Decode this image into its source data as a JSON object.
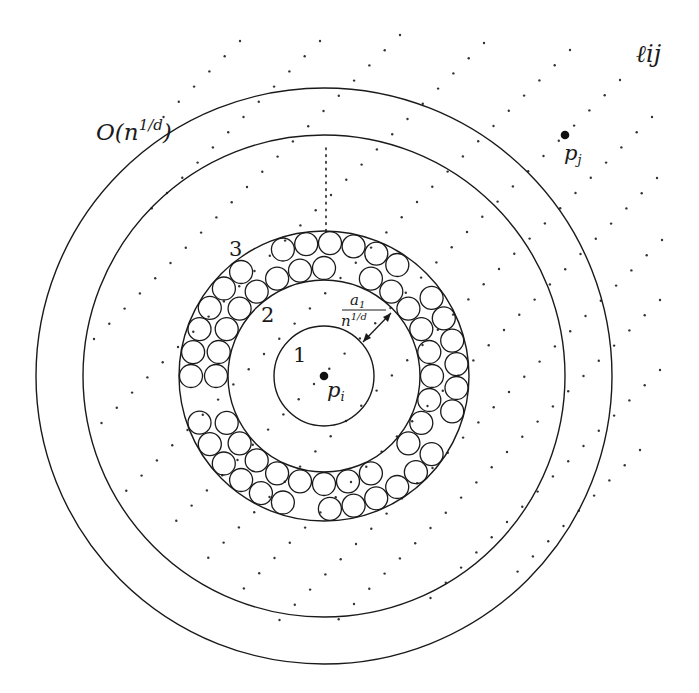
{
  "figure": {
    "center": {
      "x": 324,
      "y": 376
    },
    "circles": {
      "outer": {
        "r": 288,
        "label": "O(n^{1/d})"
      },
      "second": {
        "r": 241
      },
      "ring_outer": {
        "r": 145,
        "label": "3"
      },
      "ring_inner": {
        "r": 96,
        "label": "2"
      },
      "inner": {
        "r": 50,
        "label": "1"
      }
    },
    "small_circle_radius": 11.5,
    "points": {
      "p_i": {
        "x": 324,
        "y": 376,
        "label": "p",
        "sub": "i"
      },
      "p_j": {
        "x": 565,
        "y": 135,
        "label": "p",
        "sub": "j"
      }
    },
    "annotations": {
      "band_label": "ℓij",
      "arrow_label_num": "a",
      "arrow_label_num_sub": "1",
      "arrow_label_den": "n",
      "arrow_label_den_sup": "1/d",
      "outer_label_main": "O(n",
      "outer_label_sup": "1/d",
      "outer_label_close": ")",
      "label_1": "1",
      "label_2": "2",
      "label_3": "3"
    },
    "dot_lattice": {
      "stride": {
        "dx": -15.3,
        "dy": 15.2
      },
      "lines": [
        {
          "x": 240,
          "y": 41,
          "n": 6
        },
        {
          "x": 320,
          "y": 41,
          "n": 12
        },
        {
          "x": 400,
          "y": 35,
          "n": 21
        },
        {
          "x": 484,
          "y": 43,
          "n": 26
        },
        {
          "x": 570,
          "y": 50,
          "n": 30
        },
        {
          "x": 620,
          "y": 80,
          "n": 30
        },
        {
          "x": 652,
          "y": 117,
          "n": 30
        },
        {
          "x": 657,
          "y": 178,
          "n": 28
        },
        {
          "x": 662,
          "y": 240,
          "n": 26
        },
        {
          "x": 660,
          "y": 300,
          "n": 22
        },
        {
          "x": 660,
          "y": 370,
          "n": 16
        },
        {
          "x": 640,
          "y": 450,
          "n": 9
        }
      ],
      "dotted_vertical": {
        "x": 326,
        "y1": 148,
        "y2": 232
      }
    }
  }
}
